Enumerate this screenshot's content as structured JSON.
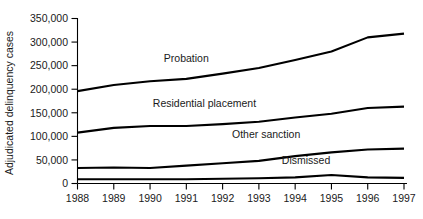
{
  "chart_data": {
    "type": "line",
    "title": "",
    "xlabel": "",
    "ylabel": "Adjudicated delinquency cases",
    "x": [
      1988,
      1989,
      1990,
      1991,
      1992,
      1993,
      1994,
      1995,
      1996,
      1997
    ],
    "xtick_labels": [
      "1988",
      "1989",
      "1990",
      "1991",
      "1992",
      "1993",
      "1994",
      "1995",
      "1996",
      "1997"
    ],
    "ytick_labels": [
      "0",
      "50,000",
      "100,000",
      "150,000",
      "200,000",
      "250,000",
      "300,000",
      "350,000"
    ],
    "ytick_values": [
      0,
      50000,
      100000,
      150000,
      200000,
      250000,
      300000,
      350000
    ],
    "ylim": [
      0,
      350000
    ],
    "xlim": [
      1988,
      1997
    ],
    "grid": false,
    "legend_position": "inline-annotations",
    "series": [
      {
        "name": "Probation",
        "label": "Probation",
        "color": "#000000",
        "values": [
          196000,
          209000,
          217000,
          222000,
          233000,
          245000,
          262000,
          280000,
          310000,
          318000
        ]
      },
      {
        "name": "Residential placement",
        "label": "Residential placement",
        "color": "#000000",
        "values": [
          108000,
          118000,
          122000,
          122000,
          126000,
          131000,
          140000,
          148000,
          160000,
          163000
        ]
      },
      {
        "name": "Other sanction",
        "label": "Other sanction",
        "color": "#000000",
        "values": [
          33000,
          34000,
          33000,
          38000,
          43000,
          48000,
          58000,
          66000,
          72000,
          74000
        ]
      },
      {
        "name": "Dismissed",
        "label": "Dismissed",
        "color": "#000000",
        "values": [
          9000,
          9000,
          9000,
          9000,
          10000,
          11000,
          13000,
          18000,
          13000,
          12000
        ]
      }
    ],
    "annotations": [
      {
        "text": "Probation",
        "x": 1991.0,
        "y": 258000
      },
      {
        "text": "Residential placement",
        "x": 1991.5,
        "y": 163000
      },
      {
        "text": "Other sanction",
        "x": 1993.2,
        "y": 96000
      },
      {
        "text": "Dismissed",
        "x": 1994.3,
        "y": 41000
      }
    ]
  }
}
